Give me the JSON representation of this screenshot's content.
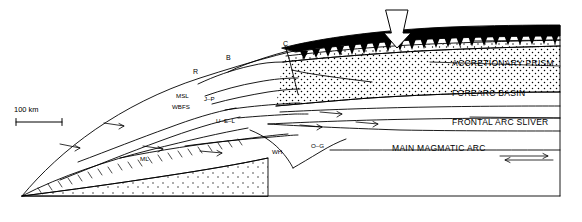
{
  "figure": {
    "type": "geologic-cross-section",
    "scale_bar": {
      "label": "100 km"
    },
    "right_labels": [
      {
        "id": "oceanic-crust",
        "text": "OCEANIC CRUST"
      },
      {
        "id": "accretionary-prism",
        "text": "ACCRETIONARY PRISM"
      },
      {
        "id": "forearc-basin",
        "text": "FOREARC BASIN"
      },
      {
        "id": "frontal-arc-sliver",
        "text": "FRONTAL ARC SLIVER"
      },
      {
        "id": "main-magmatic-arc",
        "text": "MAIN MAGMATIC ARC"
      }
    ],
    "fault_labels": [
      {
        "id": "label-r",
        "text": "R"
      },
      {
        "id": "label-b",
        "text": "B"
      },
      {
        "id": "label-c",
        "text": "C"
      },
      {
        "id": "label-msl",
        "text": "MSL"
      },
      {
        "id": "label-wbfs",
        "text": "WBFS"
      },
      {
        "id": "label-j-p",
        "text": "J–P"
      },
      {
        "id": "label-u-e-l",
        "text": "U–E–L"
      },
      {
        "id": "label-o-g",
        "text": "O–G"
      },
      {
        "id": "label-wh",
        "text": "WH"
      },
      {
        "id": "label-ml",
        "text": "ML"
      }
    ],
    "colors": {
      "ink": "#000000",
      "background": "#ffffff"
    }
  }
}
